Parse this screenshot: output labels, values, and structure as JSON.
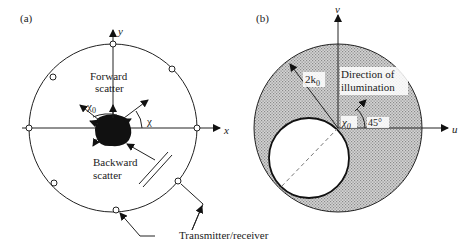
{
  "panel_a": {
    "tag": "(a)",
    "axis_x": "x",
    "axis_y": "y",
    "forward_line1": "Forward",
    "forward_line2": "scatter",
    "backward_line1": "Backward",
    "backward_line2": "scatter",
    "chi0": "χ",
    "chi0_sub": "0",
    "chi": "χ",
    "transmitter_label": "Transmitter/receiver",
    "circle_center": [
      113,
      128
    ],
    "circle_radius": 84,
    "transceiver_count": 8
  },
  "panel_b": {
    "tag": "(b)",
    "axis_u": "u",
    "axis_v": "v",
    "radius_label": "2k",
    "radius_label_sub": "0",
    "direction_line1": "Direction of",
    "direction_line2": "illumination",
    "chi0": "χ",
    "chi0_sub": "0",
    "angle_label": "45°",
    "outer_circle_center": [
      338,
      128
    ],
    "outer_circle_radius": 84,
    "inner_circle_center": [
      309,
      158
    ],
    "inner_circle_radius": 40,
    "fill_color": "#c8c8c8"
  }
}
